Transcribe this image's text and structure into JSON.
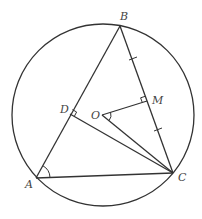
{
  "diagram": {
    "type": "geometry",
    "circle": {
      "name": "circumcircle",
      "cx": 103,
      "cy": 115,
      "r": 91
    },
    "points": {
      "A": {
        "label": "A",
        "x": 36,
        "y": 178,
        "lx": 25,
        "ly": 188
      },
      "B": {
        "label": "B",
        "x": 120,
        "y": 26,
        "lx": 120,
        "ly": 20
      },
      "C": {
        "label": "C",
        "x": 173,
        "y": 173,
        "lx": 178,
        "ly": 181
      },
      "D": {
        "label": "D",
        "x": 70,
        "y": 114,
        "lx": 60,
        "ly": 113
      },
      "O": {
        "label": "O",
        "x": 102,
        "y": 115,
        "lx": 91,
        "ly": 119
      },
      "M": {
        "label": "M",
        "x": 147,
        "y": 101,
        "lx": 152,
        "ly": 104
      }
    },
    "segments": [
      "AB",
      "BC",
      "CA",
      "DC",
      "OC",
      "OM"
    ],
    "right_angles": [
      "D",
      "M"
    ],
    "equal_ticks": [
      "BM",
      "MC"
    ],
    "angle_marks": [
      "A",
      "O"
    ],
    "stroke_color": "#333333"
  }
}
